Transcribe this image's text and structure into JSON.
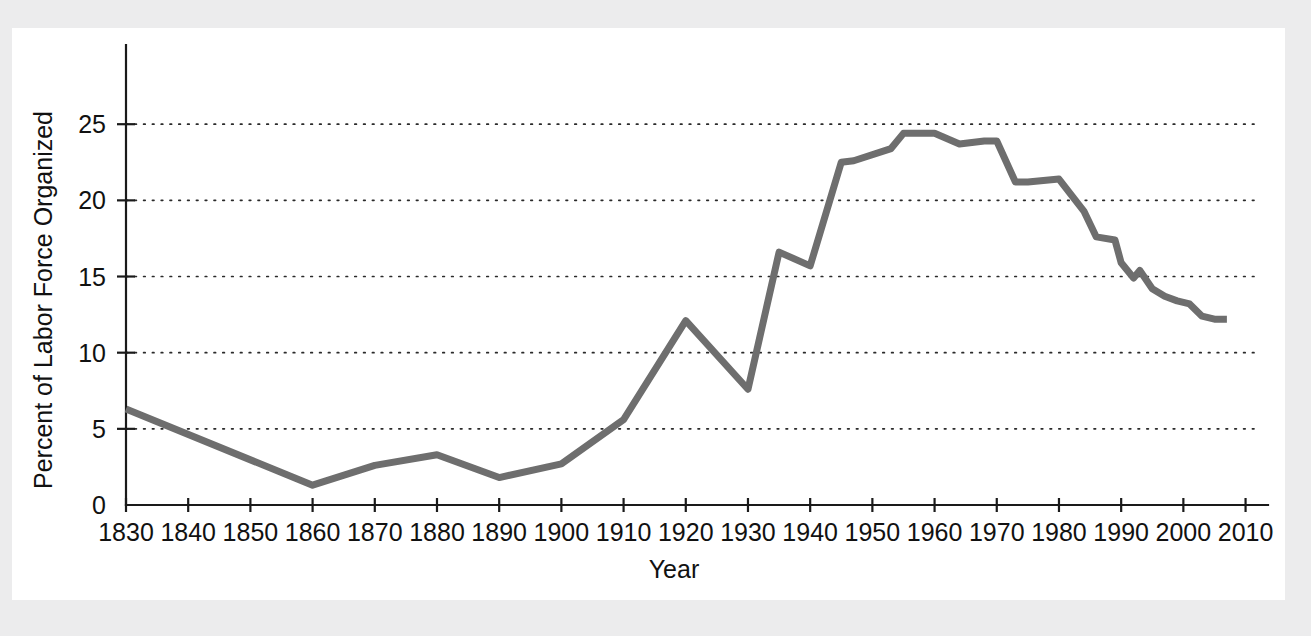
{
  "figure": {
    "background_color": "#ececed",
    "page_color": "#ffffff"
  },
  "chart_data": {
    "type": "line",
    "title": "",
    "subtitle": "",
    "xlabel": "Year",
    "ylabel": "Percent of Labor Force Organized",
    "xlim": [
      1830,
      2012
    ],
    "ylim": [
      0,
      30.2
    ],
    "xticks": [
      1830,
      1840,
      1850,
      1860,
      1870,
      1880,
      1890,
      1900,
      1910,
      1920,
      1930,
      1940,
      1950,
      1960,
      1970,
      1980,
      1990,
      2000,
      2010
    ],
    "xtick_labels": [
      "1830",
      "1840",
      "1850",
      "1860",
      "1870",
      "1880",
      "1890",
      "1900",
      "1910",
      "1920",
      "1930",
      "1940",
      "1950",
      "1960",
      "1970",
      "1980",
      "1990",
      "2000",
      "2010"
    ],
    "yticks": [
      0,
      5,
      10,
      15,
      20,
      25
    ],
    "ytick_labels": [
      "0",
      "5",
      "10",
      "15",
      "20",
      "25"
    ],
    "grid": "horizontal-dotted",
    "grid_values": [
      5,
      10,
      15,
      20,
      25
    ],
    "legend": "none",
    "line_color": "#6e6e6e",
    "line_width": 7,
    "series": [
      {
        "name": "Percent of Labor Force Organized",
        "x": [
          1830,
          1860,
          1870,
          1880,
          1890,
          1900,
          1910,
          1920,
          1930,
          1935,
          1940,
          1945,
          1947,
          1953,
          1955,
          1960,
          1964,
          1968,
          1970,
          1973,
          1975,
          1980,
          1984,
          1986,
          1989,
          1990,
          1992,
          1993,
          1995,
          1997,
          1999,
          2001,
          2003,
          2005,
          2007
        ],
        "values": [
          6.3,
          1.3,
          2.6,
          3.3,
          1.8,
          2.7,
          5.6,
          12.1,
          7.6,
          16.6,
          15.7,
          22.5,
          22.6,
          23.4,
          24.4,
          24.4,
          23.7,
          23.9,
          23.9,
          21.2,
          21.2,
          21.4,
          19.3,
          17.6,
          17.4,
          15.9,
          14.9,
          15.4,
          14.2,
          13.7,
          13.4,
          13.2,
          12.4,
          12.2,
          12.2
        ]
      }
    ]
  }
}
